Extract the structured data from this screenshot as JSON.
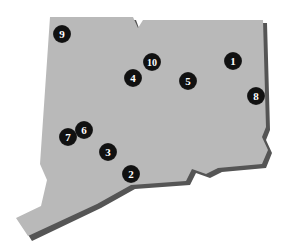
{
  "map": {
    "region": "state outline",
    "fill_color": "#b9b9b9",
    "shadow_color": "#555555",
    "marker_color": "#111111",
    "marker_text_color": "#ffffff"
  },
  "markers": [
    {
      "label": "1",
      "x": 233,
      "y": 61
    },
    {
      "label": "2",
      "x": 131,
      "y": 174
    },
    {
      "label": "3",
      "x": 108,
      "y": 152
    },
    {
      "label": "4",
      "x": 133,
      "y": 78
    },
    {
      "label": "5",
      "x": 188,
      "y": 81
    },
    {
      "label": "6",
      "x": 84,
      "y": 130
    },
    {
      "label": "7",
      "x": 68,
      "y": 137
    },
    {
      "label": "8",
      "x": 256,
      "y": 96
    },
    {
      "label": "9",
      "x": 62,
      "y": 34
    },
    {
      "label": "10",
      "x": 152,
      "y": 62
    }
  ]
}
